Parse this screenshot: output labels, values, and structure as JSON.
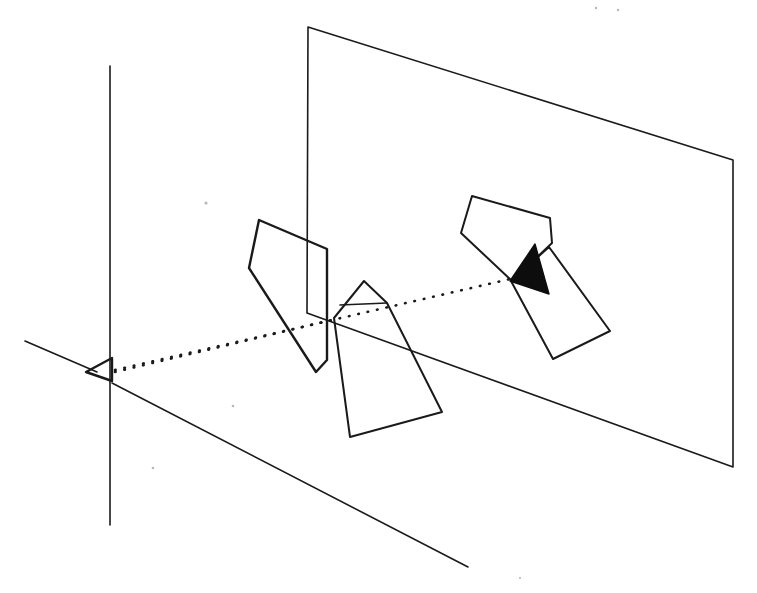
{
  "figure": {
    "background_color": "#ffffff",
    "ink_color": "#1a1a1a",
    "fill_color": "#0d0d0d",
    "width": 757,
    "height": 593,
    "labels": {
      "viewpoint": "",
      "image_plane": "",
      "object": "",
      "projection_ray": ""
    },
    "elements": {
      "vertical_axis": {
        "name": "vertical-axis-line",
        "points": "110,66 110,525"
      },
      "left_axis": {
        "name": "left-axis-line",
        "points": "25,341 97,372"
      },
      "ground_axis": {
        "name": "ground-receding-line",
        "points": "112,383 468,567"
      },
      "viewpoint_marker": {
        "name": "viewpoint-triangle",
        "points": "86,372 112,358 112,381"
      },
      "image_plane": {
        "name": "image-plane-quad",
        "points": "308,27 733,160 733,467 307,313"
      },
      "ray_upper": {
        "name": "projection-ray-upper",
        "points": "115,370 519,277"
      },
      "ray_lower": {
        "name": "projection-ray-lower",
        "points": "115,372 332,320"
      },
      "left_polygon": {
        "name": "left-polygon",
        "points": "259,220 327,249 327,360 316,372 249,268"
      },
      "middle_polygon": {
        "name": "middle-polygon",
        "points": "364,281 387,303 442,412 350,437 334,318"
      },
      "right_upper_polygon": {
        "name": "right-upper-polygon",
        "points": "472,196 550,218 552,243 512,281 461,233"
      },
      "right_lower_polygon": {
        "name": "right-lower-polygon",
        "points": "511,281 549,247 610,331 553,359"
      },
      "shaded_triangle": {
        "name": "shaded-overlap-triangle",
        "points": "535,244 549,294 510,281"
      },
      "ray_segment_middle": {
        "name": "projection-ray-mid-segment",
        "points": "340,305 387,303"
      }
    },
    "specks": [
      {
        "x": 206,
        "y": 203,
        "r": 1.6
      },
      {
        "x": 233,
        "y": 406,
        "r": 1.3
      },
      {
        "x": 153,
        "y": 468,
        "r": 1.3
      },
      {
        "x": 596,
        "y": 8,
        "r": 1.2
      },
      {
        "x": 618,
        "y": 10,
        "r": 1.2
      },
      {
        "x": 520,
        "y": 578,
        "r": 1.1
      }
    ]
  }
}
